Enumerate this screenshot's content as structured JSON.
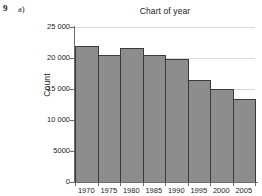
{
  "question": {
    "number": "9",
    "part": "a)"
  },
  "chart_data": {
    "type": "bar",
    "title": "Chart of year",
    "xlabel": "",
    "ylabel": "Count",
    "categories": [
      "1970",
      "1975",
      "1980",
      "1985",
      "1990",
      "1995",
      "2000",
      "2005"
    ],
    "values": [
      22000,
      20500,
      21600,
      20500,
      19900,
      16500,
      15000,
      13400
    ],
    "ylim": [
      0,
      25000
    ],
    "ytick_labels": [
      "25 000",
      "20 000",
      "15 000",
      "10 000",
      "5000",
      "0"
    ],
    "ytick_values": [
      25000,
      20000,
      15000,
      10000,
      5000,
      0
    ],
    "grid": true,
    "legend": "none",
    "bar_color": "#8d8d8d",
    "bar_edge_color": "#3a3a3a",
    "grid_color": "#d8d8d8",
    "axis_color": "#6b6b6b"
  }
}
